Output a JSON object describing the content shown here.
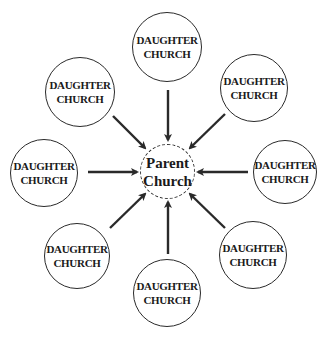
{
  "diagram": {
    "type": "hub-and-spoke",
    "center": {
      "line1": "Parent",
      "line2": "Church",
      "x": 167,
      "y": 171,
      "r": 27,
      "style": "dashed"
    },
    "satellites": [
      {
        "id": "top",
        "line1": "DAUGHTER",
        "line2": "CHURCH",
        "x": 167,
        "y": 47,
        "r": 35
      },
      {
        "id": "top-right",
        "line1": "DAUGHTER",
        "line2": "CHURCH",
        "x": 254,
        "y": 88,
        "r": 34
      },
      {
        "id": "right",
        "line1": "DAUGHTER",
        "line2": "CHURCH",
        "x": 285,
        "y": 172,
        "r": 32
      },
      {
        "id": "bottom-right",
        "line1": "DAUGHTER",
        "line2": "CHURCH",
        "x": 253,
        "y": 255,
        "r": 34
      },
      {
        "id": "bottom",
        "line1": "DAUGHTER",
        "line2": "CHURCH",
        "x": 167,
        "y": 293,
        "r": 34
      },
      {
        "id": "bottom-left",
        "line1": "DAUGHTER",
        "line2": "CHURCH",
        "x": 77,
        "y": 256,
        "r": 33
      },
      {
        "id": "left",
        "line1": "DAUGHTER",
        "line2": "CHURCH",
        "x": 44,
        "y": 173,
        "r": 34
      },
      {
        "id": "top-left",
        "line1": "DAUGHTER",
        "line2": "CHURCH",
        "x": 80,
        "y": 92,
        "r": 35
      }
    ],
    "arrow_direction": "inward",
    "colors": {
      "stroke": "#2a2a2a",
      "text": "#1a1a1a",
      "background": "#ffffff"
    }
  }
}
